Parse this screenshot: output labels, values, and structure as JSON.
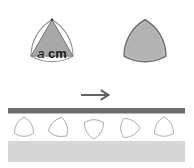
{
  "figure": {
    "width": 194,
    "height": 168,
    "background": "#ffffff",
    "caption_text": "",
    "colors": {
      "shape_fill": "#a8a8a8",
      "shape_fill_light": "#b3b3b3",
      "shape_outline": "#6e6e6e",
      "thin_outline": "#8a8a8a",
      "roller_outline": "#8c8c8c",
      "bar_fill": "#6d6d6d",
      "ground_fill": "#d6d6d6",
      "arrow_color": "#5a5a5a",
      "text_color": "#1a1a1a"
    }
  },
  "left_shape": {
    "name": "Reuleaux triangle with inscribed equilateral triangle",
    "outline_style": "thin curved outline",
    "inner_fill": "#a8a8a8",
    "label": {
      "variable": "a",
      "unit": "cm",
      "full_text": "a cm"
    }
  },
  "right_shape": {
    "name": "Filled Reuleaux triangle",
    "fill": "#b3b3b3",
    "outline": "#6e6e6e"
  },
  "arrow": {
    "icon": "arrow-right-icon",
    "direction": "right",
    "label": ""
  },
  "roller_scene": {
    "bar": {
      "name": "plank",
      "fill": "#6d6d6d"
    },
    "ground": {
      "name": "ground-band",
      "fill": "#d6d6d6"
    },
    "rollers": [
      {
        "index": 1,
        "rotation_deg": 0,
        "orientation": "vertex-up"
      },
      {
        "index": 2,
        "rotation_deg": 135,
        "orientation": "rotated"
      },
      {
        "index": 3,
        "rotation_deg": 180,
        "orientation": "vertex-down"
      },
      {
        "index": 4,
        "rotation_deg": 90,
        "orientation": "vertex-right"
      },
      {
        "index": 5,
        "rotation_deg": 0,
        "orientation": "vertex-up"
      }
    ],
    "roller_count": 5
  }
}
